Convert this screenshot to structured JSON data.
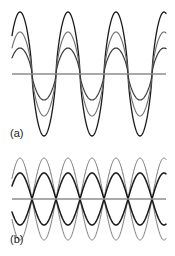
{
  "figure": {
    "background_color": "#ffffff",
    "panels": [
      {
        "id": "a",
        "label": "(a)",
        "axis": {
          "color": "#8c8c8c",
          "width": 1.6,
          "x_start": 12,
          "x_end": 166,
          "y": 74
        },
        "description": "Three nested sinusoidal waveforms of decreasing amplitude sharing a common baseline",
        "chart_geometry": {
          "period": 48,
          "phase_offset": 8,
          "cycles": 3.2,
          "sharpness": 1.45
        },
        "curves": [
          {
            "name": "outer-wave",
            "color": "#1a1a1a",
            "stroke_width": 1.3,
            "amplitude_up": 62,
            "amplitude_down": 62
          },
          {
            "name": "middle-wave",
            "color": "#6e6e6e",
            "stroke_width": 1.1,
            "amplitude_up": 42,
            "amplitude_down": 42
          },
          {
            "name": "inner-wave",
            "color": "#3a3a3a",
            "stroke_width": 1.2,
            "amplitude_up": 26,
            "amplitude_down": 26
          }
        ]
      },
      {
        "id": "b",
        "label": "(b)",
        "axis": {
          "color": "#8c8c8c",
          "width": 1.6,
          "x_start": 12,
          "x_end": 166,
          "y": 49
        },
        "description": "Two phase-offset sinusoid pairs drawn with their negatives, producing overlapping lens shapes",
        "chart_geometry": {
          "period": 48,
          "cycles": 3.2
        },
        "curves": [
          {
            "name": "gray-envelope-positive",
            "color": "#7a7a7a",
            "stroke_width": 1.0,
            "amplitude": 41,
            "phase_offset": 8
          },
          {
            "name": "gray-envelope-negative",
            "color": "#7a7a7a",
            "stroke_width": 1.0,
            "amplitude": -41,
            "phase_offset": 8
          },
          {
            "name": "black-envelope-positive",
            "color": "#1a1a1a",
            "stroke_width": 1.5,
            "amplitude": 26,
            "phase_offset": 32
          },
          {
            "name": "black-envelope-negative",
            "color": "#1a1a1a",
            "stroke_width": 1.5,
            "amplitude": -26,
            "phase_offset": 32
          }
        ]
      }
    ]
  }
}
